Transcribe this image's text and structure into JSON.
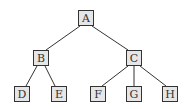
{
  "diagram": {
    "type": "tree",
    "nodes": [
      {
        "id": "A",
        "label": "A",
        "x": 78,
        "y": 10
      },
      {
        "id": "B",
        "label": "B",
        "x": 33,
        "y": 50
      },
      {
        "id": "C",
        "label": "C",
        "x": 126,
        "y": 50
      },
      {
        "id": "D",
        "label": "D",
        "x": 14,
        "y": 86
      },
      {
        "id": "E",
        "label": "E",
        "x": 51,
        "y": 86
      },
      {
        "id": "F",
        "label": "F",
        "x": 90,
        "y": 86
      },
      {
        "id": "G",
        "label": "G",
        "x": 126,
        "y": 86
      },
      {
        "id": "H",
        "label": "H",
        "x": 162,
        "y": 86
      }
    ],
    "edges": [
      [
        "A",
        "B"
      ],
      [
        "A",
        "C"
      ],
      [
        "B",
        "D"
      ],
      [
        "B",
        "E"
      ],
      [
        "C",
        "F"
      ],
      [
        "C",
        "G"
      ],
      [
        "C",
        "H"
      ]
    ],
    "colors": {
      "node_fill": "#e6e6e6",
      "node_border": "#333333",
      "edge": "#333333"
    }
  }
}
